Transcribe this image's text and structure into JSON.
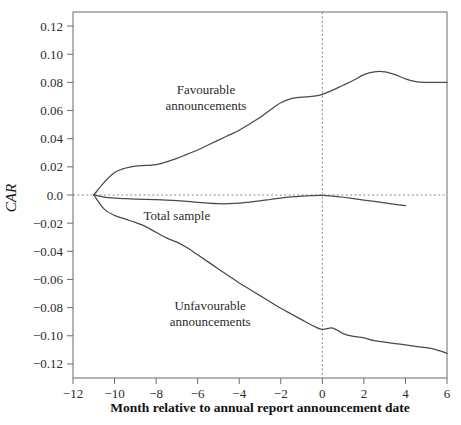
{
  "chart_data": {
    "type": "line",
    "title": "",
    "xlabel": "Month relative to annual report announcement date",
    "ylabel": "CAR",
    "xlim": [
      -12,
      6
    ],
    "ylim": [
      -0.13,
      0.13
    ],
    "grid": false,
    "legend_position": "inline-annotations",
    "xticks": [
      -12,
      -10,
      -8,
      -6,
      -4,
      -2,
      0,
      2,
      4,
      6
    ],
    "xtick_labels": [
      "−12",
      "−10",
      "−8",
      "−6",
      "−4",
      "−2",
      "0",
      "2",
      "4",
      "6"
    ],
    "yticks": [
      0.12,
      0.1,
      0.08,
      0.06,
      0.04,
      0.02,
      0.0,
      -0.02,
      -0.04,
      -0.06,
      -0.08,
      -0.1,
      -0.12
    ],
    "ytick_labels": [
      "0.12",
      "0.10",
      "0.08",
      "0.06",
      "0.04",
      "0.02",
      "0.0",
      "−0.02",
      "−0.04",
      "−0.06",
      "−0.08",
      "−0.10",
      "−0.12"
    ],
    "reference_lines": [
      {
        "name": "zero-horizontal",
        "axis": "y",
        "value": 0.0,
        "style": "dotted"
      },
      {
        "name": "event-date-vertical",
        "axis": "x",
        "value": 0,
        "style": "dotted"
      }
    ],
    "annotations": [
      {
        "name": "favourable-label",
        "text_line1": "Favourable",
        "text_line2": "announcements",
        "x": -5.6,
        "y": 0.072
      },
      {
        "name": "total-sample-label",
        "text_line1": "Total sample",
        "text_line2": "",
        "x": -7.0,
        "y": -0.018
      },
      {
        "name": "unfavourable-label",
        "text_line1": "Unfavourable",
        "text_line2": "announcements",
        "x": -5.4,
        "y": -0.082
      }
    ],
    "series": [
      {
        "name": "Favourable announcements",
        "color": "#4a4a4a",
        "x": [
          -11.0,
          -10.5,
          -10.0,
          -9.5,
          -9.0,
          -8.5,
          -8.0,
          -7.5,
          -7.0,
          -6.5,
          -6.0,
          -5.5,
          -5.0,
          -4.5,
          -4.0,
          -3.5,
          -3.0,
          -2.5,
          -2.0,
          -1.5,
          -1.0,
          -0.5,
          0.0,
          0.5,
          1.0,
          1.5,
          2.0,
          2.5,
          3.0,
          3.5,
          4.0,
          4.5,
          5.0,
          5.5,
          6.0
        ],
        "values": [
          0.0,
          0.009,
          0.016,
          0.019,
          0.0205,
          0.021,
          0.0215,
          0.0235,
          0.026,
          0.029,
          0.032,
          0.0355,
          0.039,
          0.0425,
          0.046,
          0.0505,
          0.055,
          0.0605,
          0.0655,
          0.0685,
          0.0695,
          0.07,
          0.0715,
          0.0745,
          0.078,
          0.0815,
          0.0855,
          0.0875,
          0.0875,
          0.0855,
          0.0825,
          0.0805,
          0.08,
          0.08,
          0.08
        ]
      },
      {
        "name": "Total sample",
        "color": "#4a4a4a",
        "x": [
          -11.0,
          -10.5,
          -10.0,
          -9.5,
          -9.0,
          -8.5,
          -8.0,
          -7.5,
          -7.0,
          -6.5,
          -6.0,
          -5.5,
          -5.0,
          -4.5,
          -4.0,
          -3.5,
          -3.0,
          -2.5,
          -2.0,
          -1.5,
          -1.0,
          -0.5,
          0.0,
          0.5,
          1.0,
          1.5,
          2.0,
          2.5,
          3.0,
          3.5,
          4.0
        ],
        "values": [
          0.0,
          -0.0015,
          -0.0022,
          -0.0026,
          -0.0029,
          -0.0031,
          -0.0033,
          -0.0036,
          -0.004,
          -0.0046,
          -0.0052,
          -0.0058,
          -0.0062,
          -0.0062,
          -0.0058,
          -0.005,
          -0.0042,
          -0.0032,
          -0.0022,
          -0.0014,
          -0.0008,
          -0.0004,
          -0.0003,
          -0.0008,
          -0.0016,
          -0.0026,
          -0.0036,
          -0.0046,
          -0.0056,
          -0.0066,
          -0.0076
        ]
      },
      {
        "name": "Unfavourable announcements",
        "color": "#4a4a4a",
        "x": [
          -11.0,
          -10.5,
          -10.0,
          -9.5,
          -9.0,
          -8.5,
          -8.0,
          -7.5,
          -7.0,
          -6.5,
          -6.0,
          -5.5,
          -5.0,
          -4.5,
          -4.0,
          -3.5,
          -3.0,
          -2.5,
          -2.0,
          -1.5,
          -1.0,
          -0.5,
          0.0,
          0.5,
          1.0,
          1.5,
          2.0,
          2.5,
          3.0,
          3.5,
          4.0,
          4.5,
          5.0,
          5.5,
          6.0
        ],
        "values": [
          0.0,
          -0.01,
          -0.0145,
          -0.017,
          -0.0195,
          -0.0225,
          -0.0265,
          -0.0305,
          -0.0335,
          -0.0375,
          -0.0425,
          -0.0475,
          -0.0525,
          -0.0575,
          -0.0625,
          -0.067,
          -0.0715,
          -0.076,
          -0.0805,
          -0.0845,
          -0.0885,
          -0.0925,
          -0.0955,
          -0.0945,
          -0.0985,
          -0.1005,
          -0.1015,
          -0.1035,
          -0.1045,
          -0.1055,
          -0.1065,
          -0.1075,
          -0.1085,
          -0.11,
          -0.1125
        ]
      }
    ]
  }
}
